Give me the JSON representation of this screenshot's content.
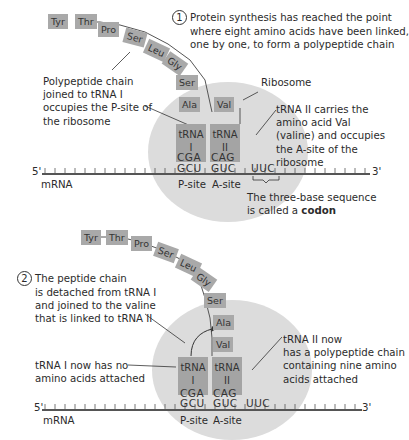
{
  "panel1": {
    "step_number": "1",
    "caption_lines": [
      "Protein synthesis has reached the point",
      "where eight amino acids have been linked,",
      "one by one, to form a polypeptide chain"
    ],
    "chain": [
      "Tyr",
      "Thr",
      "Pro",
      "Ser",
      "Leu",
      "Gly",
      "Ser",
      "Ala"
    ],
    "a_site_amino_acid": "Val",
    "label_left_lines": [
      "Polypeptide chain",
      "joined to tRNA I",
      "occupies the P-site of",
      "the ribosome"
    ],
    "label_ribosome": "Ribosome",
    "label_right_lines": [
      "tRNA II carries the",
      "amino acid Val",
      "(valine) and occupies",
      "the A-site of the",
      "ribosome"
    ],
    "trna1": {
      "line1": "tRNA",
      "line2": "I",
      "anticodon": "CGA",
      "codon": "GCU"
    },
    "trna2": {
      "line1": "tRNA",
      "line2": "II",
      "anticodon": "CAG",
      "codon": "GUC"
    },
    "next_codon": "UUC",
    "five_prime": "5'",
    "three_prime": "3'",
    "mrna_label": "mRNA",
    "p_site": "P-site",
    "a_site": "A-site",
    "codon_note_line1": "The three-base sequence",
    "codon_note_line2_prefix": "is called a ",
    "codon_note_bold": "codon"
  },
  "panel2": {
    "step_number": "2",
    "caption_lines": [
      "The peptide chain",
      "is detached from tRNA I",
      "and joined to the valine",
      "that is linked to tRNA II"
    ],
    "chain": [
      "Tyr",
      "Thr",
      "Pro",
      "Ser",
      "Leu",
      "Gly",
      "Ser",
      "Ala",
      "Val"
    ],
    "label_left_lines": [
      "tRNA I now has no",
      "amino acids attached"
    ],
    "label_right_lines": [
      "tRNA II now",
      "has a polypeptide chain",
      "containing nine amino",
      "acids attached"
    ],
    "trna1": {
      "line1": "tRNA",
      "line2": "I",
      "anticodon": "CGA",
      "codon": "GCU"
    },
    "trna2": {
      "line1": "tRNA",
      "line2": "II",
      "anticodon": "CAG",
      "codon": "GUC"
    },
    "next_codon": "UUC",
    "five_prime": "5'",
    "three_prime": "3'",
    "mrna_label": "mRNA",
    "p_site": "P-site",
    "a_site": "A-site"
  }
}
